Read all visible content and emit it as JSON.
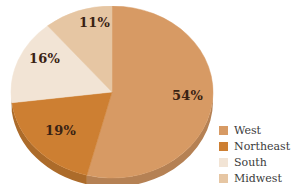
{
  "chart_data": {
    "type": "pie",
    "title": "",
    "xlabel": "",
    "ylabel": "",
    "legend_position": "bottom-right",
    "grid": false,
    "start_angle_deg": 0,
    "direction": "clockwise",
    "categories": [
      "West",
      "Northeast",
      "South",
      "Midwest"
    ],
    "values": [
      54,
      19,
      16,
      11
    ],
    "value_unit": "%",
    "data_labels": [
      "54%",
      "19%",
      "16%",
      "11%"
    ],
    "colors": [
      "#d79a64",
      "#cd7f32",
      "#f2e4d5",
      "#e6c6a3"
    ],
    "series": [
      {
        "name": "Regional share",
        "values": [
          54,
          19,
          16,
          11
        ]
      }
    ]
  },
  "slices": [
    {
      "key": "west",
      "label": "West",
      "value": 54,
      "data_label": "54%",
      "color": "#d79a64"
    },
    {
      "key": "northeast",
      "label": "Northeast",
      "value": 19,
      "data_label": "19%",
      "color": "#cd7f32"
    },
    {
      "key": "south",
      "label": "South",
      "value": 16,
      "data_label": "16%",
      "color": "#f2e4d5"
    },
    {
      "key": "midwest",
      "label": "Midwest",
      "value": 11,
      "data_label": "11%",
      "color": "#e6c6a3"
    }
  ],
  "legend": {
    "items": [
      {
        "label": "West",
        "color": "#d79a64"
      },
      {
        "label": "Northeast",
        "color": "#cd7f32"
      },
      {
        "label": "South",
        "color": "#f2e4d5"
      },
      {
        "label": "Midwest",
        "color": "#e6c6a3"
      }
    ]
  },
  "style": {
    "background": "#ffffff",
    "label_text_color": "#3a2213",
    "legend_text_color": "#3b3b3b",
    "depth_shadow_color": "#b9793f"
  }
}
